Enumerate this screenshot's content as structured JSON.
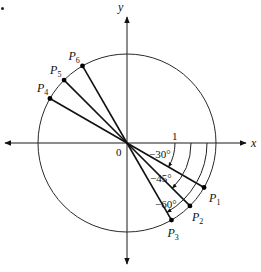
{
  "diagram": {
    "type": "unit-circle-angles",
    "colors": {
      "ink": "#111111",
      "background": "#ffffff"
    },
    "origin": {
      "x": 127,
      "y": 143,
      "label": "0"
    },
    "radius": 89,
    "axes": {
      "x": {
        "label": "x",
        "from": 5,
        "to": 246
      },
      "y": {
        "label": "y",
        "from": 264,
        "to": 17
      }
    },
    "unit_label": {
      "text": "1",
      "x": 172,
      "y": 140
    },
    "points": [
      {
        "name": "P1",
        "base": "P",
        "sub": "1",
        "angle_deg": -30,
        "label_dx": 5,
        "label_dy": 14
      },
      {
        "name": "P2",
        "base": "P",
        "sub": "2",
        "angle_deg": -45,
        "label_dx": 2,
        "label_dy": 15
      },
      {
        "name": "P3",
        "base": "P",
        "sub": "3",
        "angle_deg": -60,
        "label_dx": -4,
        "label_dy": 17
      },
      {
        "name": "P4",
        "base": "P",
        "sub": "4",
        "angle_deg": 150,
        "label_dx": -13,
        "label_dy": -7
      },
      {
        "name": "P5",
        "base": "P",
        "sub": "5",
        "angle_deg": 135,
        "label_dx": -14,
        "label_dy": -6
      },
      {
        "name": "P6",
        "base": "P",
        "sub": "6",
        "angle_deg": 120,
        "label_dx": -14,
        "label_dy": -6
      }
    ],
    "angle_arcs": [
      {
        "label": "−30°",
        "angle_deg": -30,
        "r": 48,
        "label_x": 149,
        "label_y": 158
      },
      {
        "label": "−45°",
        "angle_deg": -45,
        "r": 64,
        "label_x": 150,
        "label_y": 182
      },
      {
        "label": "−60°",
        "angle_deg": -60,
        "r": 80,
        "label_x": 155,
        "label_y": 208
      }
    ]
  }
}
